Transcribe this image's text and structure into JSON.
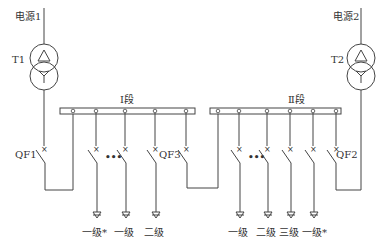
{
  "diagram": {
    "type": "single-line electrical wiring diagram",
    "sources": [
      {
        "id": "src1",
        "label": "电源1"
      },
      {
        "id": "src2",
        "label": "电源2"
      }
    ],
    "transformers": [
      {
        "id": "t1",
        "label": "T1",
        "primary": "delta",
        "secondary": "wye"
      },
      {
        "id": "t2",
        "label": "T2",
        "primary": "delta",
        "secondary": "wye"
      }
    ],
    "buses": [
      {
        "id": "bus1",
        "label": "Ⅰ段"
      },
      {
        "id": "bus2",
        "label": "Ⅱ段"
      }
    ],
    "breakers": [
      {
        "id": "qf1",
        "label": "QF1"
      },
      {
        "id": "qf2",
        "label": "QF2"
      },
      {
        "id": "qf3",
        "label": "QF3"
      }
    ],
    "ellipsis": "•••",
    "loads_bus1": [
      {
        "label": "一级*"
      },
      {
        "label": "一级"
      },
      {
        "label": "二级"
      }
    ],
    "loads_bus2": [
      {
        "label": "一级"
      },
      {
        "label": "二级"
      },
      {
        "label": "三级"
      },
      {
        "label": "一级*"
      }
    ],
    "colors": {
      "line": "#444444",
      "text": "#333333",
      "background": "#ffffff"
    }
  }
}
